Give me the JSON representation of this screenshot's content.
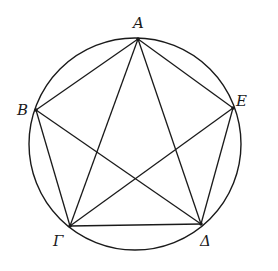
{
  "diagram": {
    "type": "inscribed-pentagon-with-diagonals",
    "circle": {
      "cx": 135,
      "cy": 144,
      "r": 106
    },
    "stroke_color": "#1a1a1a",
    "points": [
      {
        "id": "A",
        "label": "A",
        "x": 138,
        "y": 39,
        "label_x": 133,
        "label_y": 28
      },
      {
        "id": "B",
        "label": "B",
        "x": 36,
        "y": 110,
        "label_x": 17,
        "label_y": 115
      },
      {
        "id": "G",
        "label": "Γ",
        "x": 70,
        "y": 226,
        "label_x": 53,
        "label_y": 246
      },
      {
        "id": "D",
        "label": "Δ",
        "x": 201,
        "y": 224,
        "label_x": 200,
        "label_y": 246
      },
      {
        "id": "E",
        "label": "E",
        "x": 233,
        "y": 108,
        "label_x": 236,
        "label_y": 106
      }
    ],
    "sides": [
      [
        "A",
        "B"
      ],
      [
        "B",
        "G"
      ],
      [
        "G",
        "D"
      ],
      [
        "D",
        "E"
      ],
      [
        "E",
        "A"
      ]
    ],
    "diagonals": [
      [
        "A",
        "G"
      ],
      [
        "A",
        "D"
      ],
      [
        "B",
        "D"
      ],
      [
        "G",
        "E"
      ]
    ]
  }
}
